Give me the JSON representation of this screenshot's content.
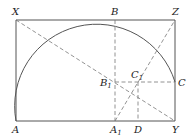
{
  "diagram": {
    "type": "geometric-construction",
    "colors": {
      "solid": "#555555",
      "dashed": "#777777",
      "text": "#222222"
    },
    "points": {
      "X": {
        "label": "X",
        "sub": "",
        "x": 16,
        "y": 20
      },
      "B": {
        "label": "B",
        "sub": "",
        "x": 115,
        "y": 20
      },
      "Z": {
        "label": "Z",
        "sub": "",
        "x": 175,
        "y": 20
      },
      "B1": {
        "label": "B",
        "sub": "1",
        "x": 115,
        "y": 82
      },
      "C1": {
        "label": "C",
        "sub": "1",
        "x": 138,
        "y": 82
      },
      "C": {
        "label": "C",
        "sub": "",
        "x": 175,
        "y": 82
      },
      "A": {
        "label": "A",
        "sub": "",
        "x": 16,
        "y": 121
      },
      "A1": {
        "label": "A",
        "sub": "1",
        "x": 115,
        "y": 121
      },
      "D": {
        "label": "D",
        "sub": "",
        "x": 138,
        "y": 121
      },
      "Y": {
        "label": "Y",
        "sub": "",
        "x": 175,
        "y": 121
      }
    },
    "solid_segments": [
      [
        "X",
        "Z"
      ],
      [
        "Z",
        "Y"
      ],
      [
        "A",
        "Y"
      ],
      [
        "X",
        "A"
      ]
    ],
    "dashed_segments": [
      [
        "X",
        "Y"
      ],
      [
        "A1",
        "Z"
      ],
      [
        "B",
        "A1"
      ],
      [
        "B1",
        "C"
      ],
      [
        "C1",
        "D"
      ]
    ],
    "arc": {
      "from": "A",
      "through": "B",
      "to": "C",
      "radius": 82
    }
  }
}
